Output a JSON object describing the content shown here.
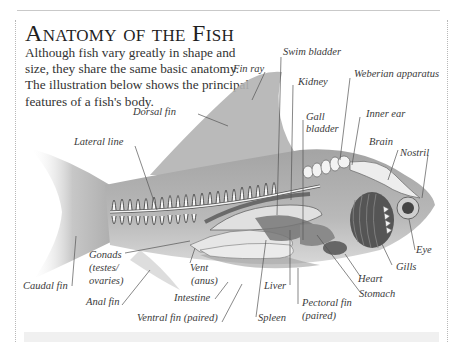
{
  "page": {
    "title": "Anatomy of the Fish",
    "intro": "Although fish vary greatly in shape and size, they share the same basic anatomy. The illustration below shows the principal features of a fish's body."
  },
  "labels": {
    "fin_ray": "Fin ray",
    "swim_bladder": "Swim bladder",
    "kidney": "Kidney",
    "weberian_apparatus": "Weberian apparatus",
    "dorsal_fin": "Dorsal fin",
    "gall_bladder_1": "Gall",
    "gall_bladder_2": "bladder",
    "inner_ear": "Inner ear",
    "brain": "Brain",
    "nostril": "Nostril",
    "lateral_line": "Lateral line",
    "eye": "Eye",
    "gills": "Gills",
    "heart": "Heart",
    "stomach": "Stomach",
    "gonads_1": "Gonads",
    "gonads_2": "(testes/",
    "gonads_3": "ovaries)",
    "caudal_fin": "Caudal fin",
    "vent_1": "Vent",
    "vent_2": "(anus)",
    "anal_fin": "Anal fin",
    "intestine": "Intestine",
    "ventral_fin": "Ventral fin (paired)",
    "liver": "Liver",
    "spleen": "Spleen",
    "pectoral_fin_1": "Pectoral fin",
    "pectoral_fin_2": "(paired)"
  },
  "colors": {
    "body": "#a9a9a9",
    "fin": "#c4c4c4",
    "organ_light": "#e2e2e2",
    "organ_dark": "#6e6e6e",
    "spine": "#f4f4f4",
    "leader": "#555555"
  }
}
